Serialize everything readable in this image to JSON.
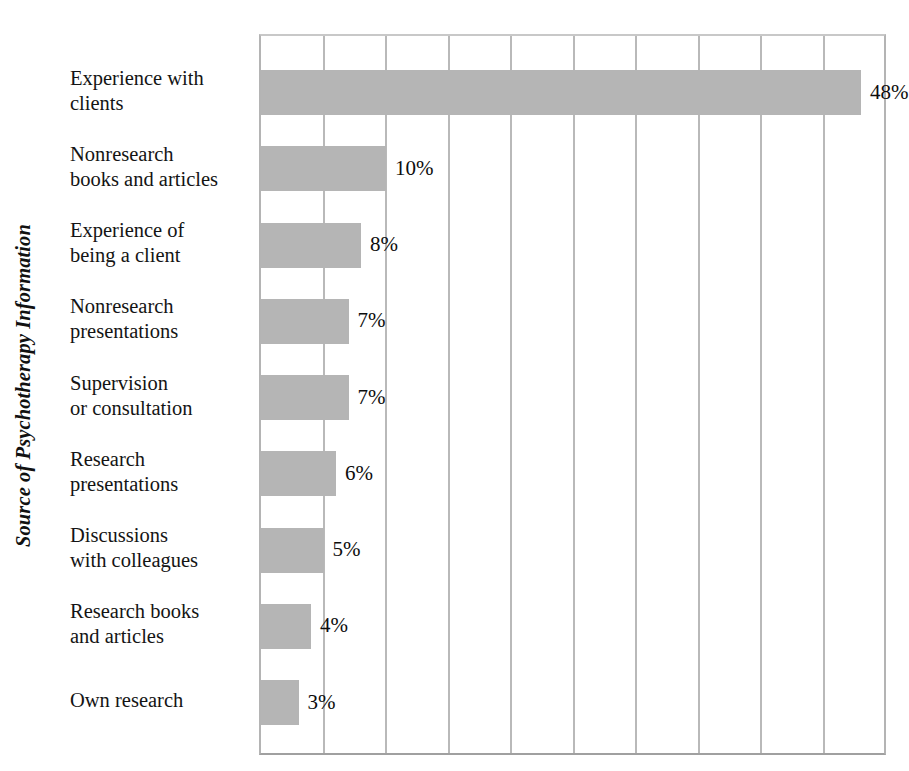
{
  "chart_data": {
    "type": "bar",
    "orientation": "horizontal",
    "title": "",
    "xlabel": "",
    "ylabel": "Source of Psychotherapy Information",
    "categories": [
      "Experience with\nclients",
      "Nonresearch\nbooks and articles",
      "Experience of\nbeing a client",
      "Nonresearch\npresentations",
      "Supervision\nor consultation",
      "Research\npresentations",
      "Discussions\nwith colleagues",
      "Research books\nand articles",
      "Own research"
    ],
    "values": [
      48,
      10,
      8,
      7,
      7,
      6,
      5,
      4,
      3
    ],
    "value_labels": [
      "48%",
      "10%",
      "8%",
      "7%",
      "7%",
      "6%",
      "5%",
      "4%",
      "3%"
    ],
    "xlim": [
      0,
      50
    ],
    "xticks": [
      0,
      5,
      10,
      15,
      20,
      25,
      30,
      35,
      40,
      45,
      50
    ],
    "xtick_labels": [
      "",
      "",
      "",
      "",
      "",
      "",
      "",
      "",
      "",
      "",
      ""
    ],
    "grid": "vertical",
    "legend": "none",
    "bar_color": "#b5b5b5",
    "gridline_color": "#b9b9b9",
    "text_color": "#111111",
    "background_color": "#ffffff"
  }
}
